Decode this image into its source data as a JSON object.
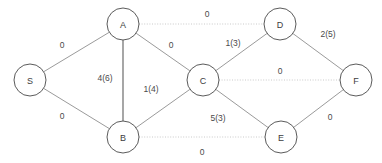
{
  "diagram": {
    "type": "node-link-graph",
    "width": 382,
    "height": 163,
    "background_color": "#ffffff",
    "node_fill": "#ffffff",
    "node_stroke": "#5b5b5b",
    "edge_color": "#8e8e8e",
    "edge_dotted_color": "#c4c4c4",
    "label_color": "#4a4a4a"
  },
  "nodes": [
    {
      "id": "S",
      "label": "S",
      "x": 30,
      "y": 80,
      "r": 16
    },
    {
      "id": "A",
      "label": "A",
      "x": 123,
      "y": 24,
      "r": 16
    },
    {
      "id": "B",
      "label": "B",
      "x": 123,
      "y": 137,
      "r": 16
    },
    {
      "id": "C",
      "label": "C",
      "x": 203,
      "y": 80,
      "r": 16
    },
    {
      "id": "D",
      "label": "D",
      "x": 280,
      "y": 24,
      "r": 16
    },
    {
      "id": "E",
      "label": "E",
      "x": 281,
      "y": 137,
      "r": 16
    },
    {
      "id": "F",
      "label": "F",
      "x": 356,
      "y": 80,
      "r": 16
    }
  ],
  "edges": [
    {
      "id": "S-A",
      "from": "S",
      "to": "A",
      "label": "0",
      "style": "solid",
      "label_x": 62,
      "label_y": 45
    },
    {
      "id": "S-B",
      "from": "S",
      "to": "B",
      "label": "0",
      "style": "solid",
      "label_x": 62,
      "label_y": 116
    },
    {
      "id": "A-D",
      "from": "A",
      "to": "D",
      "label": "0",
      "style": "dotted",
      "label_x": 207,
      "label_y": 14
    },
    {
      "id": "A-C",
      "from": "A",
      "to": "C",
      "label": "0",
      "style": "solid",
      "label_x": 171,
      "label_y": 45
    },
    {
      "id": "A-B",
      "from": "A",
      "to": "B",
      "label": "4(6)",
      "style": "heavy",
      "label_x": 105,
      "label_y": 78
    },
    {
      "id": "B-C",
      "from": "B",
      "to": "C",
      "label": "1(4)",
      "style": "solid",
      "label_x": 151,
      "label_y": 89
    },
    {
      "id": "C-D",
      "from": "C",
      "to": "D",
      "label": "1(3)",
      "style": "solid",
      "label_x": 233,
      "label_y": 43
    },
    {
      "id": "C-F",
      "from": "C",
      "to": "F",
      "label": "0",
      "style": "dotted",
      "label_x": 280,
      "label_y": 71
    },
    {
      "id": "D-F",
      "from": "D",
      "to": "F",
      "label": "2(5)",
      "style": "solid",
      "label_x": 328,
      "label_y": 34
    },
    {
      "id": "C-E",
      "from": "C",
      "to": "E",
      "label": "5(3)",
      "style": "solid",
      "label_x": 218,
      "label_y": 118
    },
    {
      "id": "E-F",
      "from": "E",
      "to": "F",
      "label": "0",
      "style": "solid",
      "label_x": 330,
      "label_y": 117
    },
    {
      "id": "B-E",
      "from": "B",
      "to": "E",
      "label": "0",
      "style": "dotted",
      "label_x": 202,
      "label_y": 152
    }
  ]
}
